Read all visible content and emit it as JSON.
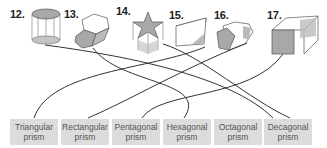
{
  "figures": [
    {
      "number": "12.",
      "shape": "octagonal-prism"
    },
    {
      "number": "13.",
      "shape": "hexagonal-prism"
    },
    {
      "number": "14.",
      "shape": "star-prism"
    },
    {
      "number": "15.",
      "shape": "triangular-prism"
    },
    {
      "number": "16.",
      "shape": "pentagonal-prism"
    },
    {
      "number": "17.",
      "shape": "rectangular-prism"
    }
  ],
  "labels": [
    {
      "line1": "Triangular",
      "line2": "prism"
    },
    {
      "line1": "Rectangular",
      "line2": "prism"
    },
    {
      "line1": "Pentagonal",
      "line2": "prism"
    },
    {
      "line1": "Hexagonal",
      "line2": "prism"
    },
    {
      "line1": "Octagonal",
      "line2": "prism"
    },
    {
      "line1": "Decagonal",
      "line2": "prism"
    }
  ],
  "colors": {
    "shade": "#a8a8a8",
    "label_bg": "#dcdcdc",
    "line": "#333333"
  }
}
